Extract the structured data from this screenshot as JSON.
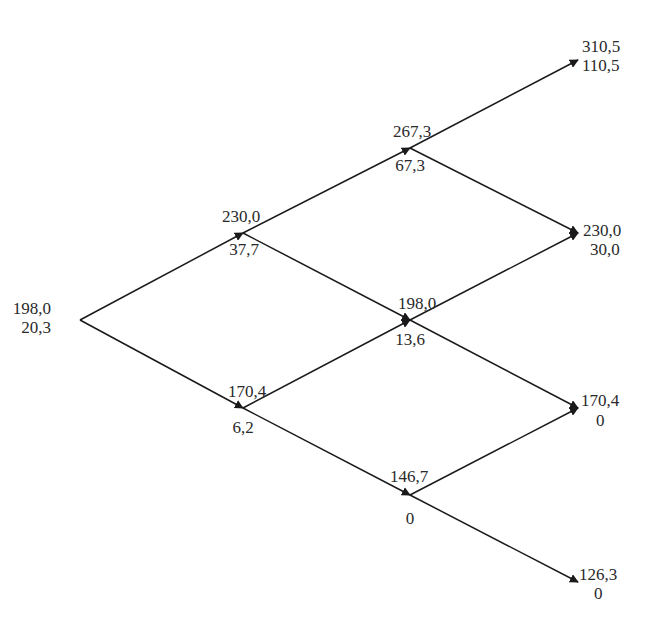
{
  "diagram": {
    "type": "binomial-tree",
    "colors": {
      "line": "#1a1a1a",
      "text": "#2a2a2a",
      "background": "#ffffff"
    },
    "nodes": {
      "n0": {
        "price": "198,0",
        "value": "20,3"
      },
      "u1": {
        "price": "230,0",
        "value": "37,7"
      },
      "d1": {
        "price": "170,4",
        "value": "6,2"
      },
      "uu2": {
        "price": "267,3",
        "value": "67,3"
      },
      "ud2": {
        "price": "198,0",
        "value": "13,6"
      },
      "dd2": {
        "price": "146,7",
        "value": "0"
      },
      "uuu3": {
        "price": "310,5",
        "value": "110,5"
      },
      "uud3": {
        "price": "230,0",
        "value": "30,0"
      },
      "udd3": {
        "price": "170,4",
        "value": "0"
      },
      "ddd3": {
        "price": "126,3",
        "value": "0"
      }
    },
    "edges": [
      [
        "n0",
        "u1"
      ],
      [
        "n0",
        "d1"
      ],
      [
        "u1",
        "uu2"
      ],
      [
        "u1",
        "ud2"
      ],
      [
        "d1",
        "ud2"
      ],
      [
        "d1",
        "dd2"
      ],
      [
        "uu2",
        "uuu3"
      ],
      [
        "uu2",
        "uud3"
      ],
      [
        "ud2",
        "uud3"
      ],
      [
        "ud2",
        "udd3"
      ],
      [
        "dd2",
        "udd3"
      ],
      [
        "dd2",
        "ddd3"
      ]
    ]
  }
}
